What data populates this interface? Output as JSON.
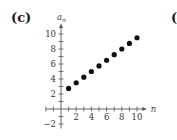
{
  "panel_label": "(c)",
  "next_panel_label": "(d",
  "chart_data": {
    "type": "scatter",
    "title": "",
    "xlabel": "n",
    "ylabel": "a_n",
    "x": [
      1,
      2,
      3,
      4,
      5,
      6,
      7,
      8,
      9,
      10
    ],
    "series": [
      {
        "name": "a_n",
        "values": [
          2.75,
          3.5,
          4.25,
          5,
          5.75,
          6.5,
          7.25,
          8,
          8.75,
          9.5
        ]
      }
    ],
    "x_ticks": [
      2,
      4,
      6,
      8,
      10
    ],
    "y_ticks": [
      -2,
      2,
      4,
      6,
      8,
      10
    ],
    "xlim": [
      -2,
      11
    ],
    "ylim": [
      -2.5,
      11
    ],
    "grid": false,
    "legend": "none"
  }
}
